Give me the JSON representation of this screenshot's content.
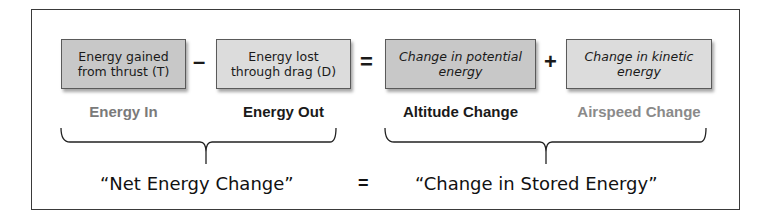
{
  "boxes": [
    {
      "text_line1": "Energy gained",
      "text_line2": "from thrust (T)"
    },
    {
      "text_line1": "Energy lost",
      "text_line2": "through drag (D)"
    },
    {
      "text_line1": "Change in potential",
      "text_line2": "energy"
    },
    {
      "text_line1": "Change in kinetic",
      "text_line2": "energy"
    }
  ],
  "operators": {
    "minus": "–",
    "equals": "=",
    "plus": "+"
  },
  "labels": [
    {
      "text": "Energy In",
      "color": "#7a7a7a"
    },
    {
      "text": "Energy Out",
      "color": "#1a1a1a"
    },
    {
      "text": "Altitude Change",
      "color": "#1a1a1a"
    },
    {
      "text": "Airspeed Change",
      "color": "#8a8a8a"
    }
  ],
  "bottom": {
    "left": "“Net Energy Change”",
    "equals": "=",
    "right": "“Change in Stored Energy”"
  }
}
